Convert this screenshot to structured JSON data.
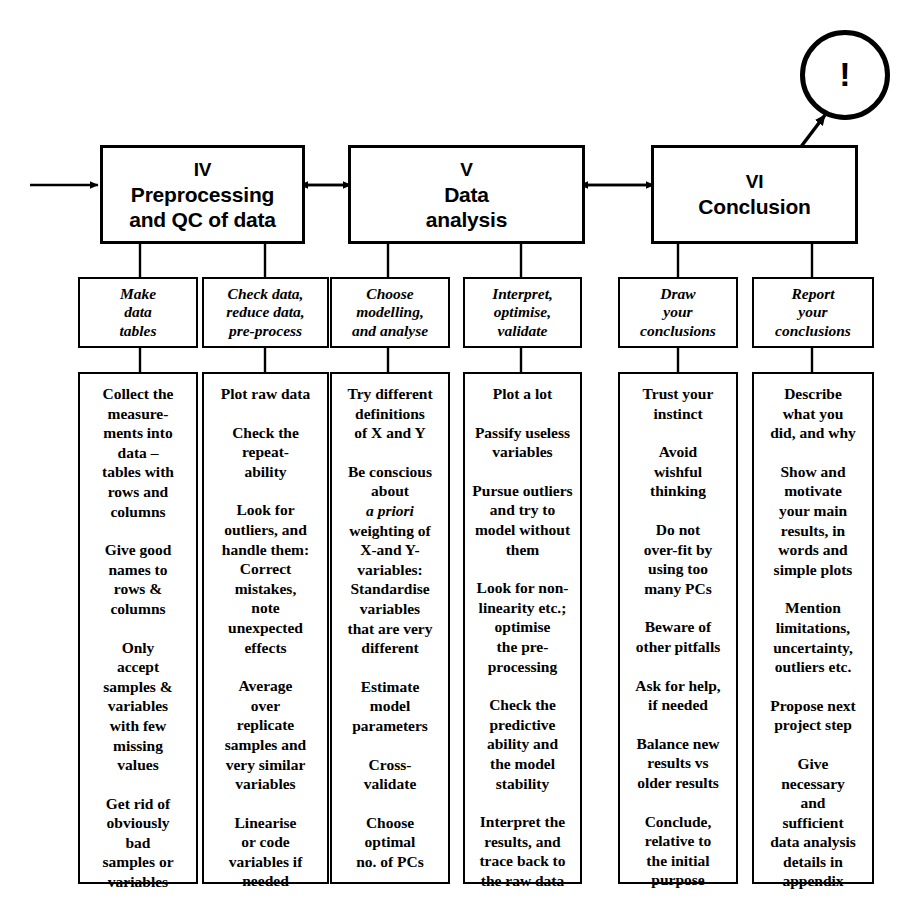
{
  "diagram": {
    "alert_symbol": "!",
    "stages": [
      {
        "numeral": "IV",
        "title": "Preprocessing\nand QC of data"
      },
      {
        "numeral": "V",
        "title": "Data\nanalysis"
      },
      {
        "numeral": "VI",
        "title": "Conclusion"
      }
    ],
    "tasks": [
      {
        "label": "Make\ndata\ntables"
      },
      {
        "label": "Check data,\nreduce data,\npre-process"
      },
      {
        "label": "Choose\nmodelling,\nand analyse"
      },
      {
        "label": "Interpret,\noptimise,\nvalidate"
      },
      {
        "label": "Draw\nyour\nconclusions"
      },
      {
        "label": "Report\nyour\nconclusions"
      }
    ],
    "columns": [
      {
        "name": "make-data-tables",
        "items": [
          "Collect the\nmeasure-\nments into\ndata –\ntables with\nrows and\ncolumns",
          "Give good\nnames to\nrows &\ncolumns",
          "Only\naccept\nsamples &\nvariables\nwith few\nmissing\nvalues",
          "Get rid of\nobviously\nbad\nsamples or\nvariables"
        ]
      },
      {
        "name": "check-reduce-preprocess",
        "items": [
          "Plot raw data",
          "Check the\nrepeat-\nability",
          "Look for\noutliers, and\nhandle them:\nCorrect\nmistakes,\nnote\nunexpected\neffects",
          "Average\nover\nreplicate\nsamples and\nvery similar\nvariables",
          "Linearise\nor code\nvariables if\nneeded"
        ]
      },
      {
        "name": "choose-modelling",
        "items": [
          "Try different\ndefinitions\nof X and Y",
          "Be conscious\nabout\n@i{a priori}\nweighting of\nX-and Y-\nvariables:\nStandardise\nvariables\nthat are very\ndifferent",
          "Estimate\nmodel\nparameters",
          "Cross-\nvalidate",
          "Choose\noptimal\nno. of PCs"
        ]
      },
      {
        "name": "interpret-optimise-validate",
        "items": [
          "Plot a lot",
          "Passify useless\nvariables",
          "Pursue outliers\nand try to\nmodel without\nthem",
          "Look for non-\nlinearity etc.;\noptimise\nthe pre-\nprocessing",
          "Check the\npredictive\nability and\nthe model\nstability",
          "Interpret the\nresults, and\ntrace back to\nthe raw data"
        ]
      },
      {
        "name": "draw-your-conclusions",
        "items": [
          "Trust your\ninstinct",
          "Avoid\nwishful\nthinking",
          "Do not\nover-fit by\nusing too\nmany PCs",
          "Beware of\nother pitfalls",
          "Ask for help,\nif needed",
          "Balance new\nresults vs\nolder results",
          "Conclude,\nrelative to\nthe initial\npurpose"
        ]
      },
      {
        "name": "report-your-conclusions",
        "items": [
          "Describe\nwhat you\ndid, and why",
          "Show and\nmotivate\nyour main\nresults, in\nwords and\nsimple plots",
          "Mention\nlimitations,\nuncertainty,\noutliers etc.",
          "Propose next\nproject step",
          "Give\nnecessary\nand\nsufficient\ndata analysis\ndetails in\nappendix"
        ]
      }
    ],
    "colors": {
      "stroke": "#000000",
      "fill": "#ffffff",
      "text": "#000000"
    }
  }
}
